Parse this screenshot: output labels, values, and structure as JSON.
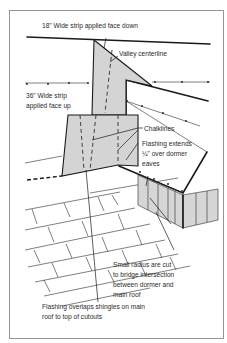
{
  "diagram": {
    "colors": {
      "flashing_fill": "#d4d4d4",
      "line": "#1a1a1a",
      "frame": "#8a8a8a",
      "text": "#2b2b2b"
    },
    "labels": {
      "strip_18": "18\" Wide strip applied face down",
      "valley_centerline": "Valley centerline",
      "strip_36_line1": "36\" Wide strip",
      "strip_36_line2": "applied face up",
      "chalklines": "Chalklines",
      "flashing_extends_line1": "Flashing extends",
      "flashing_extends_line2": "¼\" over dormer",
      "flashing_extends_line3": "eaves",
      "small_radius_line1": "Small radius are cut",
      "small_radius_line2": "to bridge intersection",
      "small_radius_line3": "between dormer and",
      "small_radius_line4": "main roof",
      "overlap_line1": "Flashing overlaps shingles on main",
      "overlap_line2": "roof to top of cutouts"
    }
  }
}
